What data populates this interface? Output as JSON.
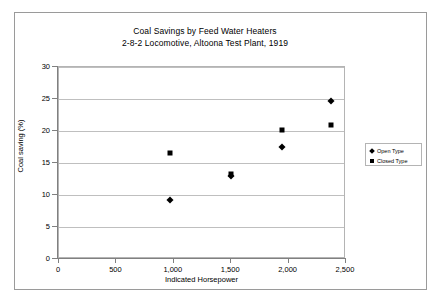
{
  "chart_data": {
    "type": "scatter",
    "title": "Coal Savings by Feed Water Heaters",
    "subtitle": "2-8-2 Locomotive, Altoona Test Plant, 1919",
    "xlabel": "Indicated Horsepower",
    "ylabel": "Coal saving (%)",
    "xlim": [
      0,
      2500
    ],
    "ylim": [
      0,
      30
    ],
    "xticks": [
      0,
      500,
      1000,
      1500,
      2000,
      2500
    ],
    "xtick_labels": [
      "0",
      "500",
      "1,000",
      "1,500",
      "2,000",
      "2,500"
    ],
    "yticks": [
      0,
      5,
      10,
      15,
      20,
      25,
      30
    ],
    "ytick_labels": [
      "0",
      "5",
      "10",
      "15",
      "20",
      "25",
      "30"
    ],
    "grid": "horizontal",
    "legend_position": "right",
    "series": [
      {
        "name": "Open Type",
        "marker": "diamond",
        "color": "#000000",
        "points": [
          {
            "x": 975,
            "y": 9.1
          },
          {
            "x": 1510,
            "y": 12.8
          },
          {
            "x": 1950,
            "y": 17.4
          },
          {
            "x": 2380,
            "y": 24.6
          }
        ]
      },
      {
        "name": "Closed Type",
        "marker": "square",
        "color": "#000000",
        "points": [
          {
            "x": 975,
            "y": 16.4
          },
          {
            "x": 1510,
            "y": 13.2
          },
          {
            "x": 1950,
            "y": 20.0
          },
          {
            "x": 2380,
            "y": 20.8
          }
        ]
      }
    ]
  }
}
